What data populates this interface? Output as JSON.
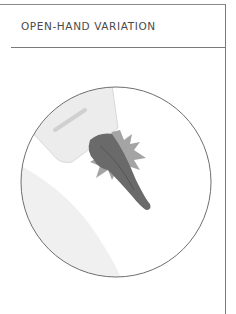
{
  "header": {
    "title": "OPEN-HAND VARIATION"
  },
  "illustration": {
    "subject": "open-hand strike to arm, impact burst",
    "colors": {
      "outline": "#6e6e6e",
      "sleeve": "#e8e8e8",
      "hand": "#6a6a6a",
      "burst": "#9a9a9a",
      "shadow": "#eeeeee"
    }
  }
}
